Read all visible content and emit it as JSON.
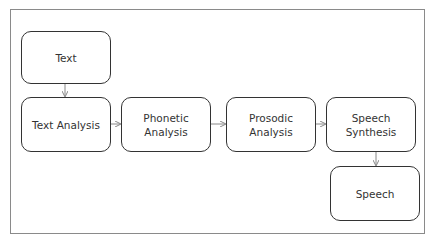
{
  "diagram": {
    "type": "flowchart",
    "title": "",
    "nodes": [
      {
        "id": "text",
        "label": "Text"
      },
      {
        "id": "text_analysis",
        "label": "Text Analysis"
      },
      {
        "id": "phonetic_analysis",
        "label": "Phonetic Analysis"
      },
      {
        "id": "prosodic_analysis",
        "label": "Prosodic Analysis"
      },
      {
        "id": "speech_synthesis",
        "label": "Speech Synthesis"
      },
      {
        "id": "speech",
        "label": "Speech"
      }
    ],
    "edges": [
      {
        "from": "text",
        "to": "text_analysis"
      },
      {
        "from": "text_analysis",
        "to": "phonetic_analysis"
      },
      {
        "from": "phonetic_analysis",
        "to": "prosodic_analysis"
      },
      {
        "from": "prosodic_analysis",
        "to": "speech_synthesis"
      },
      {
        "from": "speech_synthesis",
        "to": "speech"
      }
    ],
    "colors": {
      "node_border": "#333333",
      "edge": "#888888",
      "frame": "#8a8a8a"
    }
  }
}
